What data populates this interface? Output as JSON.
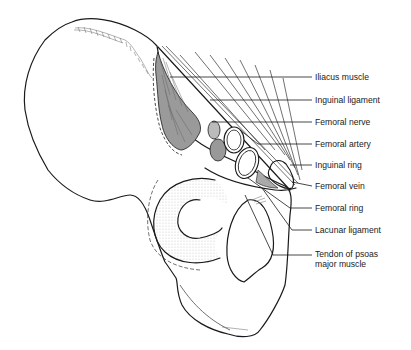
{
  "figure": {
    "labels": [
      {
        "id": "iliacus",
        "text": "Iliacus muscle",
        "x": 315,
        "y": 78
      },
      {
        "id": "inguinal-ligament",
        "text": "Inguinal ligament",
        "x": 315,
        "y": 101
      },
      {
        "id": "femoral-nerve",
        "text": "Femoral nerve",
        "x": 315,
        "y": 123
      },
      {
        "id": "femoral-artery",
        "text": "Femoral artery",
        "x": 315,
        "y": 145
      },
      {
        "id": "inguinal-ring",
        "text": "Inguinal ring",
        "x": 315,
        "y": 166
      },
      {
        "id": "femoral-vein",
        "text": "Femoral vein",
        "x": 315,
        "y": 187
      },
      {
        "id": "femoral-ring",
        "text": "Femoral ring",
        "x": 315,
        "y": 209
      },
      {
        "id": "lacunar-ligament",
        "text": "Lacunar ligament",
        "x": 315,
        "y": 231
      },
      {
        "id": "psoas-tendon",
        "text": "Tendon of psoas\nmajor muscle",
        "x": 315,
        "y": 253
      }
    ],
    "colors": {
      "line": "#1a1a1a",
      "muscle_fill": "#9a9a9a",
      "background": "#ffffff"
    }
  }
}
